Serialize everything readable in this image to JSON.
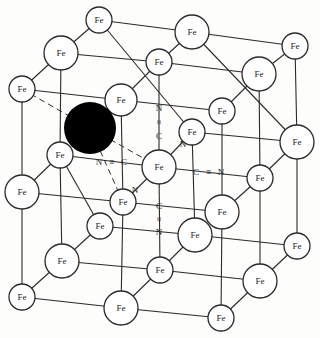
{
  "diagram": {
    "type": "crystal-lattice",
    "colors": {
      "line": "#2a2a2a",
      "atom_fill": "#ffffff",
      "interstitial": "#000000",
      "background": "#fdfdfc"
    },
    "atom_label": "Fe",
    "atoms": [
      {
        "x": 99,
        "y": 20,
        "r": 13
      },
      {
        "x": 192,
        "y": 32,
        "r": 17
      },
      {
        "x": 295,
        "y": 46,
        "r": 13
      },
      {
        "x": 61,
        "y": 53,
        "r": 17
      },
      {
        "x": 159,
        "y": 62,
        "r": 13
      },
      {
        "x": 259,
        "y": 74,
        "r": 17
      },
      {
        "x": 22,
        "y": 89,
        "r": 13
      },
      {
        "x": 121,
        "y": 100,
        "r": 16
      },
      {
        "x": 222,
        "y": 111,
        "r": 13
      },
      {
        "x": 192,
        "y": 132,
        "r": 13
      },
      {
        "x": 297,
        "y": 142,
        "r": 17
      },
      {
        "x": 60,
        "y": 155,
        "r": 13
      },
      {
        "x": 159,
        "y": 167,
        "r": 17
      },
      {
        "x": 260,
        "y": 178,
        "r": 13
      },
      {
        "x": 22,
        "y": 192,
        "r": 17
      },
      {
        "x": 123,
        "y": 202,
        "r": 13
      },
      {
        "x": 222,
        "y": 212,
        "r": 17
      },
      {
        "x": 100,
        "y": 226,
        "r": 13
      },
      {
        "x": 195,
        "y": 235,
        "r": 17
      },
      {
        "x": 297,
        "y": 246,
        "r": 13
      },
      {
        "x": 62,
        "y": 261,
        "r": 17
      },
      {
        "x": 160,
        "y": 270,
        "r": 13
      },
      {
        "x": 260,
        "y": 281,
        "r": 17
      },
      {
        "x": 22,
        "y": 297,
        "r": 13
      },
      {
        "x": 121,
        "y": 308,
        "r": 17
      },
      {
        "x": 221,
        "y": 318,
        "r": 13
      }
    ],
    "interstitial": {
      "x": 90,
      "y": 128,
      "r": 26
    },
    "cyanide_groups": [
      {
        "label_c": "C",
        "label_n": "N",
        "bond": "≡",
        "orientation": "vertical-up",
        "n": {
          "x": 159,
          "y": 108
        },
        "c": {
          "x": 159,
          "y": 136
        }
      },
      {
        "label_c": "C",
        "label_n": "N",
        "bond": "≡",
        "orientation": "horizontal-left",
        "n": {
          "x": 99,
          "y": 162
        },
        "c": {
          "x": 124,
          "y": 162
        }
      },
      {
        "label_c": "C",
        "label_n": "N",
        "bond": "≡",
        "orientation": "horizontal-right",
        "c": {
          "x": 196,
          "y": 172
        },
        "n": {
          "x": 221,
          "y": 172
        }
      },
      {
        "label_c": "C",
        "label_n": "N",
        "bond": "≡",
        "orientation": "vertical-down",
        "c": {
          "x": 159,
          "y": 206
        },
        "n": {
          "x": 159,
          "y": 232
        }
      },
      {
        "label_c": "C",
        "label_n": "N",
        "bond": "≡",
        "orientation": "diag-up-right",
        "n": {
          "x": 183,
          "y": 144
        }
      },
      {
        "label_c": "C",
        "label_n": "N",
        "bond": "≡",
        "orientation": "diag-down-left",
        "n": {
          "x": 135,
          "y": 190
        }
      }
    ]
  }
}
